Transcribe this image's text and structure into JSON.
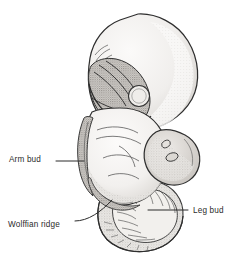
{
  "figure": {
    "background_color": "#ffffff",
    "ink_color": "#2b2b2b",
    "labels": [
      {
        "id": "arm_bud",
        "text": "Arm bud",
        "x": 9,
        "y": 155
      },
      {
        "id": "wolffian_ridge",
        "text": "Wolffian ridge",
        "x": 8,
        "y": 220
      },
      {
        "id": "leg_bud",
        "text": "Leg bud",
        "x": 193,
        "y": 206
      }
    ],
    "leader_lines": [
      {
        "id": "arm_bud_leader",
        "from": [
          56,
          161
        ],
        "to": [
          84,
          161
        ]
      },
      {
        "id": "wolffian_ridge_leader",
        "from": [
          75,
          221
        ],
        "to": [
          112,
          200
        ]
      },
      {
        "id": "leg_bud_leader",
        "from": [
          188,
          210
        ],
        "to": [
          148,
          210
        ]
      }
    ],
    "structures": [
      {
        "id": "head",
        "name": "Head / forebrain",
        "shade": "light"
      },
      {
        "id": "optic_vesicle",
        "name": "Optic vesicle",
        "shade": "outline"
      },
      {
        "id": "pharyngeal_arch",
        "name": "Pharyngeal arches",
        "shade": "dark"
      },
      {
        "id": "arm_bud",
        "name": "Arm bud",
        "shade": "dark"
      },
      {
        "id": "trunk",
        "name": "Trunk",
        "shade": "light"
      },
      {
        "id": "leg_bud",
        "name": "Leg bud",
        "shade": "medium"
      },
      {
        "id": "tail",
        "name": "Tail with somites",
        "shade": "medium"
      },
      {
        "id": "wolffian_ridge",
        "name": "Wolffian ridge",
        "shade": "dark"
      }
    ],
    "colors": {
      "ink": "#2b2b2b",
      "light_fill": "#f4f3f1",
      "medium_fill": "#d8d5d1",
      "dark_fill": "#a9a5a1",
      "stipple": "#8d8a86"
    }
  }
}
